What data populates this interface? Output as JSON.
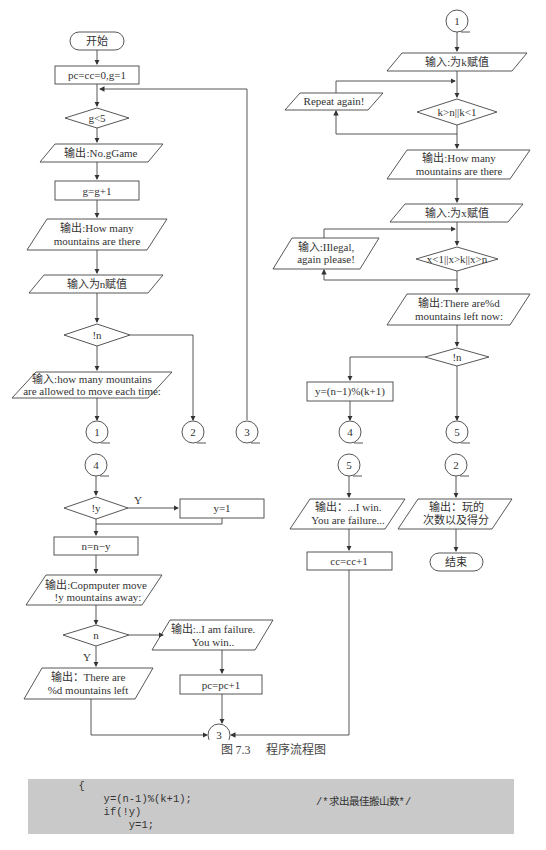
{
  "figure": {
    "caption_number": "图 7.3",
    "caption_title": "程序流程图"
  },
  "flowchart": {
    "left": {
      "start": "开始",
      "init": "pc=cc=0,g=1",
      "cond_g": "g<5",
      "out_game": "输出:No.gGame",
      "inc_g": "g=g+1",
      "out_how_many_1": "输出:How many",
      "out_how_many_2": "mountains are there",
      "in_n": "输入为n赋值",
      "cond_n": "!n",
      "in_move_1": "输入:how many mountains",
      "in_move_2": "are allowed to move each time:",
      "conn_1": "1",
      "conn_2": "2",
      "conn_3": "3"
    },
    "right_top": {
      "conn_1": "1",
      "in_k": "输入:为k赋值",
      "repeat": "Repeat again!",
      "cond_k": "k>n||k<1",
      "out_how_many_1": "输出:How many",
      "out_how_many_2": "mountains are there",
      "in_x": "输入:为x赋值",
      "illegal_1": "输入:IIlegal,",
      "illegal_2": "again please!",
      "cond_x": "x<1||x>k||x>n",
      "out_left_1": "输出:There are%d",
      "out_left_2": "mountains left now:",
      "cond_n": "!n",
      "calc_y": "y=(n−1)%(k+1)",
      "conn_4": "4",
      "conn_5": "5"
    },
    "bottom_left": {
      "conn_4": "4",
      "cond_y": "!y",
      "y_label": "Y",
      "set_y": "y=1",
      "sub_n": "n=n−y",
      "out_comp_1": "输出:Copmputer move",
      "out_comp_2": "!y mountains away:",
      "cond_n": "n",
      "n_y_label": "Y",
      "out_fail_1": "输出:..I am failure.",
      "out_fail_2": "You win..",
      "out_remain_1": "输出：There are",
      "out_remain_2": "%d mountains left",
      "inc_pc": "pc=pc+1",
      "conn_3": "3"
    },
    "bottom_mid": {
      "conn_5": "5",
      "out_win_1": "输出：...I win.",
      "out_win_2": "You are failure...",
      "inc_cc": "cc=cc+1"
    },
    "bottom_right": {
      "conn_2": "2",
      "out_score_1": "输出：玩的",
      "out_score_2": "次数以及得分",
      "end": "结束"
    }
  },
  "code": {
    "line1": "        {",
    "line2": "            y=(n-1)%(k+1);",
    "line3": "            if(!y)",
    "line4": "                y=1;",
    "comment": "/*求出最佳搬山数*/"
  }
}
